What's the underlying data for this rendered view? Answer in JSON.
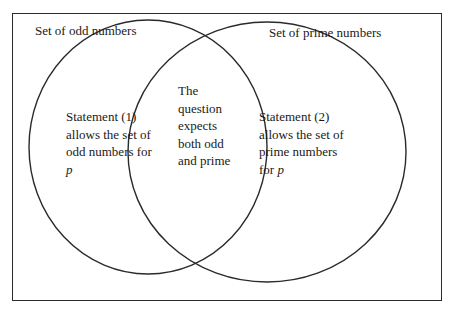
{
  "diagram": {
    "type": "venn",
    "sets": [
      {
        "id": "odd",
        "label": "Set of odd numbers"
      },
      {
        "id": "prime",
        "label": "Set of prime numbers"
      }
    ],
    "regions": {
      "odd_only": {
        "lines": [
          "Statement (1)",
          "allows the set of",
          "odd numbers for"
        ],
        "variable": "p"
      },
      "intersection": {
        "lines": [
          "The",
          "question",
          "expects",
          "both odd",
          "and prime"
        ]
      },
      "prime_only": {
        "lines": [
          "Statement (2)",
          "allows the set of",
          "prime numbers"
        ],
        "last_prefix": "for ",
        "variable": "p"
      }
    },
    "colors": {
      "stroke": "#2a2a2a",
      "background": "#ffffff",
      "text": "#1a1a1a"
    }
  }
}
